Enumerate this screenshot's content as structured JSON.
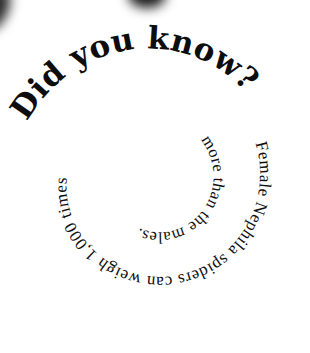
{
  "spiral_text": {
    "outer": "Did you know?",
    "middle": "Female Nephila spiders can weigh 1,000 times",
    "inner": "more than the males."
  },
  "full_text": "Did you know? Female Nephila spiders can weigh 1,000 times more than the males.",
  "colors": {
    "background": "#ffffff",
    "text": "#0d0d0d"
  }
}
